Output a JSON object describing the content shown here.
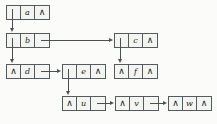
{
  "diagram": {
    "null_symbol": "∧",
    "background_color": "#fbfbfa",
    "node_fill_color": "#f4f4f2",
    "stroke_color": "#555a5e",
    "nodes": [
      {
        "id": "a",
        "label": "a",
        "left_cell": "pointer",
        "right_cell": "null",
        "x": 6,
        "y": 5
      },
      {
        "id": "b",
        "label": "b",
        "left_cell": "pointer",
        "right_cell": "pointer",
        "x": 6,
        "y": 33
      },
      {
        "id": "c",
        "label": "c",
        "left_cell": "pointer",
        "right_cell": "null",
        "x": 114,
        "y": 33
      },
      {
        "id": "d",
        "label": "d",
        "left_cell": "null",
        "right_cell": "pointer",
        "x": 6,
        "y": 64
      },
      {
        "id": "e",
        "label": "e",
        "left_cell": "pointer",
        "right_cell": "null",
        "x": 62,
        "y": 64
      },
      {
        "id": "f",
        "label": "f",
        "left_cell": "null",
        "right_cell": "null",
        "x": 114,
        "y": 64
      },
      {
        "id": "u",
        "label": "u",
        "left_cell": "null",
        "right_cell": "pointer",
        "x": 62,
        "y": 96
      },
      {
        "id": "v",
        "label": "v",
        "left_cell": "null",
        "right_cell": "pointer",
        "x": 115,
        "y": 96
      },
      {
        "id": "w",
        "label": "w",
        "left_cell": "null",
        "right_cell": "null",
        "x": 168,
        "y": 96
      }
    ],
    "edges": [
      {
        "from": "a",
        "from_cell": "left",
        "to": "b",
        "to_side": "top",
        "kind": "vertical"
      },
      {
        "from": "b",
        "from_cell": "left",
        "to": "d",
        "to_side": "top",
        "kind": "vertical"
      },
      {
        "from": "b",
        "from_cell": "right",
        "to": "c",
        "to_side": "left",
        "kind": "horizontal"
      },
      {
        "from": "c",
        "from_cell": "left",
        "to": "f",
        "to_side": "top",
        "kind": "vertical"
      },
      {
        "from": "d",
        "from_cell": "right",
        "to": "e",
        "to_side": "left",
        "kind": "horizontal"
      },
      {
        "from": "e",
        "from_cell": "left",
        "to": "u",
        "to_side": "top",
        "kind": "vertical-up"
      },
      {
        "from": "u",
        "from_cell": "right",
        "to": "v",
        "to_side": "left",
        "kind": "horizontal"
      },
      {
        "from": "v",
        "from_cell": "right",
        "to": "w",
        "to_side": "left",
        "kind": "horizontal"
      }
    ]
  }
}
